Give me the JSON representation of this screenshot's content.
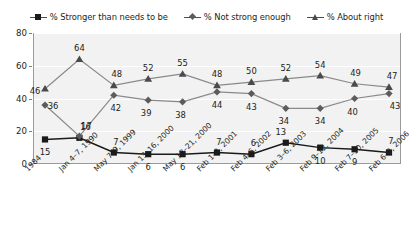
{
  "chart_data": {
    "type": "line",
    "title": "",
    "xlabel": "",
    "ylabel": "",
    "ylim": [
      0,
      80
    ],
    "yticks": [
      0,
      20,
      40,
      60,
      80
    ],
    "grid": true,
    "legend_position": "top",
    "categories": [
      "1984",
      "Jan 4–7, 1990",
      "May 7–9, 1999",
      "Jan 13–16, 2000",
      "May 18–21, 2000",
      "Feb 1–4, 2001",
      "Feb 4–6, 2002",
      "Feb 3–6, 2003",
      "Feb 9–12, 2004",
      "Feb 7–10, 2005",
      "Feb 6–9, 2006"
    ],
    "series": [
      {
        "name": "% Stronger than needs to be",
        "marker": "square",
        "color": "#1a1a1a",
        "values": [
          15,
          16,
          7,
          6,
          6,
          7,
          6,
          13,
          10,
          9,
          7
        ]
      },
      {
        "name": "% Not strong enough",
        "marker": "diamond",
        "color": "#5c5c5c",
        "values": [
          36,
          17,
          42,
          39,
          38,
          44,
          43,
          34,
          34,
          40,
          43
        ]
      },
      {
        "name": "% About right",
        "marker": "triangle",
        "color": "#4a4a4a",
        "values": [
          46,
          64,
          48,
          52,
          55,
          48,
          50,
          52,
          54,
          49,
          47
        ]
      }
    ]
  },
  "legend": {
    "items": [
      {
        "label": "% Stronger than needs to be",
        "marker": "square"
      },
      {
        "label": "% Not strong enough",
        "marker": "diamond"
      },
      {
        "label": "% About right",
        "marker": "triangle"
      }
    ]
  },
  "source_note": ""
}
